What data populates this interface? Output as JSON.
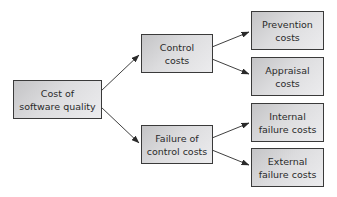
{
  "diagram": {
    "root": {
      "label": "Cost of\nsoftware quality"
    },
    "level1": [
      {
        "label": "Control\ncosts"
      },
      {
        "label": "Failure of\ncontrol costs"
      }
    ],
    "level2": [
      {
        "label": "Prevention\ncosts",
        "parent": 0
      },
      {
        "label": "Appraisal\ncosts",
        "parent": 0
      },
      {
        "label": "Internal\nfailure costs",
        "parent": 1
      },
      {
        "label": "External\nfailure costs",
        "parent": 1
      }
    ],
    "colors": {
      "box_border": "#3a3a3a",
      "box_fill_dark": "#c4c4c6",
      "box_fill_light": "#ececee",
      "arrow": "#2a2a2a",
      "text": "#2a2a2a"
    }
  }
}
